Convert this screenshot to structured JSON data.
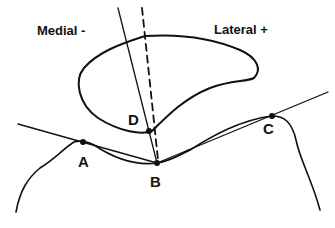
{
  "diagram": {
    "labels": {
      "medial": "Medial -",
      "lateral": "Lateral +"
    },
    "points": {
      "A": "A",
      "B": "B",
      "C": "C",
      "D": "D"
    },
    "colors": {
      "line": "#111111",
      "background": "#ffffff"
    }
  }
}
